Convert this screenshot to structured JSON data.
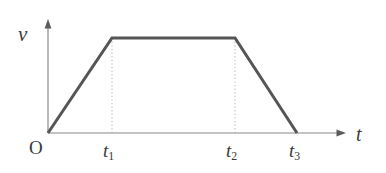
{
  "figure": {
    "title": "",
    "background_color": "#ffffff",
    "axis_color": "#8a8a8a",
    "curve_color": "#555555",
    "guide_color": "#b0b0b0",
    "text_color": "#3a3a3a"
  },
  "axes": {
    "y_label": "v",
    "x_label": "t",
    "origin_label": "O"
  },
  "ticks": {
    "t1": {
      "symbol": "t",
      "subscript": "1"
    },
    "t2": {
      "symbol": "t",
      "subscript": "2"
    },
    "t3": {
      "symbol": "t",
      "subscript": "3"
    }
  },
  "chart_data": {
    "type": "line",
    "title": "",
    "xlabel": "t",
    "ylabel": "v",
    "x": [
      0,
      112,
      235,
      297
    ],
    "y": [
      0,
      1,
      1,
      0
    ],
    "x_tick_labels": [
      "O",
      "t₁",
      "t₂",
      "t₃"
    ],
    "y_tick_labels": [],
    "series": [
      {
        "name": "velocity",
        "points": [
          {
            "x": 0,
            "y": 0,
            "label": "O"
          },
          {
            "x": 112,
            "y": 1,
            "label": "t₁"
          },
          {
            "x": 235,
            "y": 1,
            "label": "t₂"
          },
          {
            "x": 297,
            "y": 0,
            "label": "t₃"
          }
        ]
      }
    ],
    "annotations": [
      {
        "type": "dotted-guide",
        "from_x": 112,
        "note": "vertical dotted line at t₁"
      },
      {
        "type": "dotted-guide",
        "from_x": 235,
        "note": "vertical dotted line at t₂"
      }
    ],
    "xlim": [
      0,
      345
    ],
    "ylim": [
      0,
      1.18
    ],
    "grid": false,
    "legend": "none"
  },
  "geometry": {
    "origin": {
      "x": 48,
      "y": 133
    },
    "y_axis_top": {
      "x": 48,
      "y": 22
    },
    "x_axis_end": {
      "x": 345,
      "y": 133
    },
    "vertex_t1": {
      "x": 112,
      "y": 38
    },
    "vertex_t2": {
      "x": 235,
      "y": 38
    },
    "vertex_t3": {
      "x": 297,
      "y": 133
    }
  }
}
